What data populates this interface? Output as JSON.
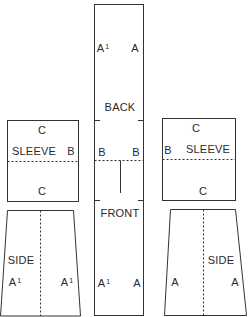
{
  "diagram": {
    "type": "garment-pattern-layout",
    "pieces": {
      "back_front": {
        "labels": {
          "top_left": "A",
          "top_left_sup": "1",
          "top_right": "A",
          "back": "BACK",
          "mid_left": "B",
          "mid_right": "B",
          "front": "FRONT",
          "bottom_left": "A",
          "bottom_left_sup": "1",
          "bottom_right": "A"
        }
      },
      "left_sleeve": {
        "labels": {
          "top": "C",
          "name": "SLEEVE",
          "side": "B",
          "bottom": "C"
        }
      },
      "right_sleeve": {
        "labels": {
          "top": "C",
          "name": "SLEEVE",
          "side": "B",
          "bottom": "C"
        }
      },
      "left_side": {
        "labels": {
          "name": "SIDE",
          "left": "A",
          "left_sup": "1",
          "right": "A",
          "right_sup": "1"
        }
      },
      "right_side": {
        "labels": {
          "name": "SIDE",
          "left": "A",
          "right": "A"
        }
      }
    },
    "colors": {
      "line": "#333333",
      "background": "#ffffff"
    }
  }
}
